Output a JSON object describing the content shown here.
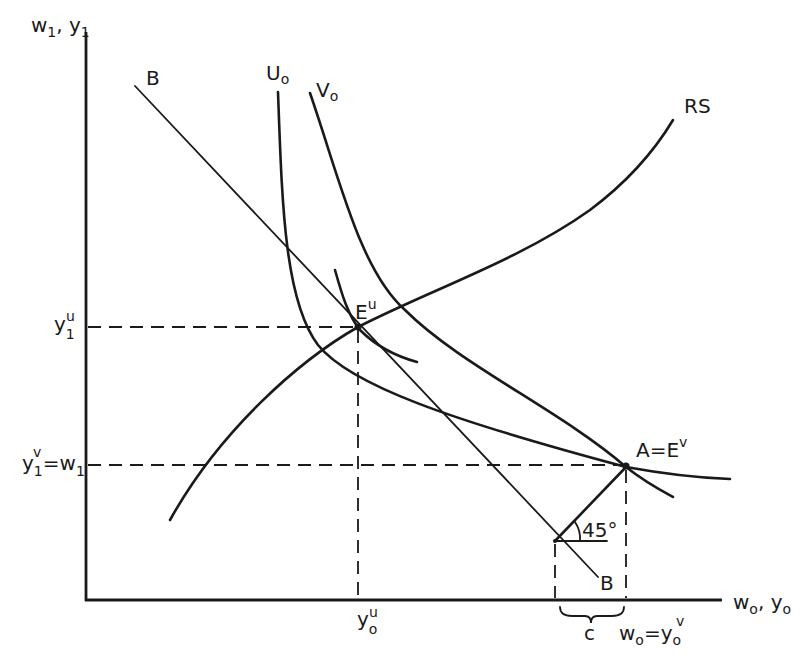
{
  "diagram": {
    "axes": {
      "y_label": {
        "main": "w",
        "sub1": "1",
        "sep": ", ",
        "main2": "y",
        "sub2": "1"
      },
      "x_label": {
        "main": "w",
        "sub1": "o",
        "sep": ", ",
        "main2": "y",
        "sub2": "o"
      }
    },
    "curves": {
      "budget_line": {
        "label_top": "B",
        "label_bottom": "B"
      },
      "u0": {
        "label": "U",
        "sub": "o"
      },
      "v0": {
        "label": "V",
        "sub": "o"
      },
      "rs": {
        "label": "RS"
      }
    },
    "points": {
      "eu": {
        "label": "E",
        "sup": "u"
      },
      "a": {
        "label": "A",
        "eq": "=",
        "label2": "E",
        "sup": "v"
      }
    },
    "y_ticks": {
      "y1u": {
        "main": "y",
        "sub": "1",
        "sup": "u"
      },
      "y1v": {
        "main": "y",
        "sub": "1",
        "sup": "v",
        "eq": "=",
        "main2": "w",
        "sub2": "1"
      }
    },
    "x_ticks": {
      "y0u": {
        "main": "y",
        "sub": "o",
        "sup": "u"
      },
      "c": {
        "label": "c"
      },
      "w0": {
        "main": "w",
        "sub": "o",
        "eq": "=",
        "main2": "y",
        "sub2": "o",
        "sup2": "v"
      }
    },
    "angle": {
      "label": "45°"
    },
    "colors": {
      "ink": "#1a1a1a",
      "background": "#ffffff"
    }
  }
}
